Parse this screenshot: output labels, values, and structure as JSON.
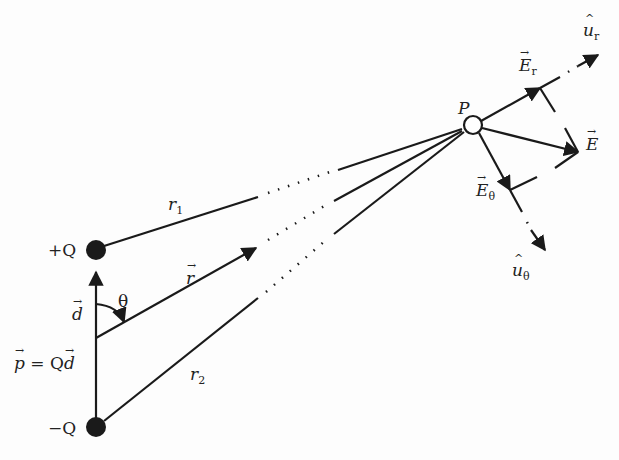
{
  "diagram": {
    "labels": {
      "plus_q": "+Q",
      "minus_q": "−Q",
      "p": "P",
      "r1": "r",
      "r1_sub": "1",
      "r2": "r",
      "r2_sub": "2",
      "r_vec": "r",
      "d_vec": "d",
      "theta": "θ",
      "dipole_p": "p",
      "dipole_eq": " = Q",
      "dipole_d": "d",
      "e_vec": "E",
      "e_r": "E",
      "e_r_sub": "r",
      "e_theta": "E",
      "e_theta_sub": "θ",
      "u_r": "u",
      "u_r_sub": "r",
      "u_theta": "u",
      "u_theta_sub": "θ"
    },
    "points": {
      "plus_q": [
        96,
        250
      ],
      "minus_q": [
        96,
        427
      ],
      "origin": [
        96,
        338
      ],
      "P": [
        473,
        125
      ]
    },
    "colors": {
      "ink": "#1a1a1a",
      "background": "#fdfdfd"
    }
  }
}
